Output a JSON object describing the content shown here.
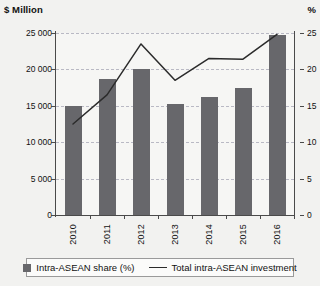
{
  "chart_data": {
    "type": "bar",
    "title": "",
    "xlabel": "",
    "ylabel": "$ Million",
    "y2label": "%",
    "categories": [
      "2010",
      "2011",
      "2012",
      "2013",
      "2014",
      "2015",
      "2016"
    ],
    "grid": true,
    "legend_position": "bottom",
    "ylim": [
      0,
      25000
    ],
    "y2lim": [
      0,
      25
    ],
    "yticks": [
      "0",
      "5 000",
      "10 000",
      "15 000",
      "20 000",
      "25 000"
    ],
    "ytick_values": [
      0,
      5000,
      10000,
      15000,
      20000,
      25000
    ],
    "y2ticks": [
      "0",
      "5",
      "10",
      "15",
      "20",
      "25"
    ],
    "y2tick_values": [
      0,
      5,
      10,
      15,
      20,
      25
    ],
    "series": [
      {
        "name": "Intra-ASEAN share (%)",
        "type": "bar",
        "axis": "right",
        "color": "#67676b",
        "values": [
          15.0,
          18.7,
          20.0,
          15.2,
          16.2,
          17.5,
          24.7
        ]
      },
      {
        "name": "Total intra-ASEAN investment",
        "type": "line",
        "axis": "left",
        "color": "#2b2b2b",
        "values": [
          12500,
          16500,
          23500,
          18500,
          21500,
          21400,
          24800
        ]
      }
    ]
  },
  "axes": {
    "left_title": "$ Million",
    "right_title": "%"
  },
  "legend": {
    "items": [
      {
        "label": "Intra-ASEAN share (%)",
        "marker": "square-swatch",
        "color": "#67676b"
      },
      {
        "label": "Total intra-ASEAN investment",
        "marker": "line-swatch",
        "color": "#2b2b2b"
      }
    ]
  }
}
